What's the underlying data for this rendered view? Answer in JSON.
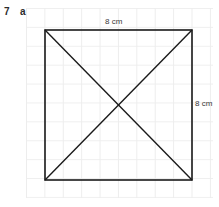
{
  "question": {
    "number": "7",
    "part": "a"
  },
  "figure": {
    "name": "square-with-diagonals",
    "shape": "square",
    "labels": {
      "top": "8 cm",
      "right": "8 cm"
    },
    "colors": {
      "outline": "#1a1a1a",
      "diagonal": "#1a1a1a",
      "grid": "#ededed",
      "background": "#ffffff"
    },
    "geometry": {
      "square": {
        "left": 45,
        "top": 30,
        "right": 192,
        "bottom": 180
      },
      "diagonals": [
        {
          "x1": 45,
          "y1": 30,
          "x2": 192,
          "y2": 180
        },
        {
          "x1": 192,
          "y1": 30,
          "x2": 45,
          "y2": 180
        }
      ],
      "center": {
        "x": 118.5,
        "y": 105
      }
    }
  }
}
